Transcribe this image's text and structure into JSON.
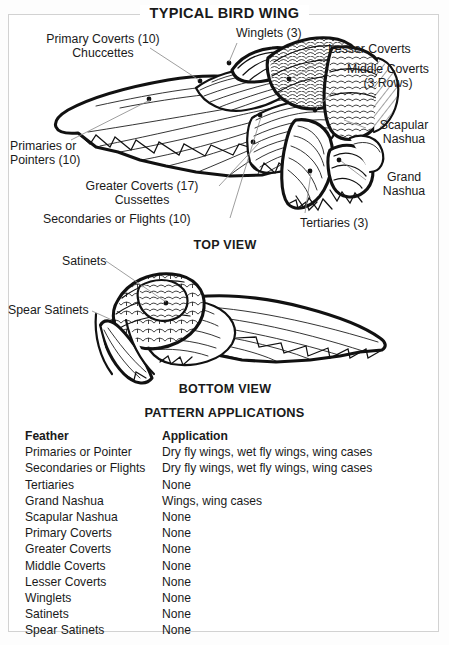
{
  "diagram": {
    "title": "TYPICAL BIRD WING",
    "views": {
      "top": "TOP VIEW",
      "bottom": "BOTTOM VIEW"
    },
    "callouts_upper": [
      {
        "id": "primary-coverts",
        "text": "Primary Coverts (10)\nChuccettes"
      },
      {
        "id": "winglets",
        "text": "Winglets (3)"
      },
      {
        "id": "lesser-coverts",
        "text": "Lesser Coverts"
      },
      {
        "id": "middle-coverts",
        "text": "Middle Coverts\n(3 Rows)"
      },
      {
        "id": "scapular-nashua",
        "text": "Scapular\nNashua"
      },
      {
        "id": "grand-nashua",
        "text": "Grand\nNashua"
      },
      {
        "id": "primaries",
        "text": "Primaries or\nPointers (10)"
      },
      {
        "id": "greater-coverts",
        "text": "Greater Coverts (17)\nCussettes"
      },
      {
        "id": "secondaries",
        "text": "Secondaries or Flights (10)"
      },
      {
        "id": "tertiaries",
        "text": "Tertiaries (3)"
      }
    ],
    "callouts_lower": [
      {
        "id": "satinets",
        "text": "Satinets"
      },
      {
        "id": "spear-satinets",
        "text": "Spear Satinets"
      }
    ]
  },
  "table": {
    "title": "PATTERN APPLICATIONS",
    "headers": {
      "feather": "Feather",
      "application": "Application"
    },
    "rows": [
      {
        "feather": "Primaries or Pointer",
        "application": "Dry fly wings, wet fly wings, wing cases"
      },
      {
        "feather": "Secondaries or Flights",
        "application": "Dry fly wings, wet fly wings, wing cases"
      },
      {
        "feather": "Tertiaries",
        "application": "None"
      },
      {
        "feather": "Grand Nashua",
        "application": "Wings, wing cases"
      },
      {
        "feather": "Scapular Nashua",
        "application": "None"
      },
      {
        "feather": "Primary Coverts",
        "application": "None"
      },
      {
        "feather": "Greater Coverts",
        "application": "None"
      },
      {
        "feather": "Middle Coverts",
        "application": "None"
      },
      {
        "feather": "Lesser Coverts",
        "application": "None"
      },
      {
        "feather": "Winglets",
        "application": "None"
      },
      {
        "feather": "Satinets",
        "application": "None"
      },
      {
        "feather": "Spear Satinets",
        "application": "None"
      }
    ]
  },
  "colors": {
    "ink": "#1a1a1a",
    "frame": "#d2d2d2",
    "leader": "#8c8c8c"
  }
}
